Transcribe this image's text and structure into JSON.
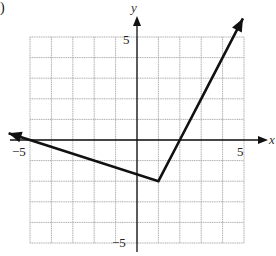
{
  "problem_label": ")",
  "chart_data": {
    "type": "line",
    "title": "",
    "xlabel": "x",
    "ylabel": "y",
    "xlim": [
      -5,
      5
    ],
    "ylim": [
      -5,
      5
    ],
    "grid": true,
    "grid_step": 1,
    "tick_labels": {
      "x": [
        "-5",
        "5"
      ],
      "y": [
        "5",
        "-5"
      ]
    },
    "series": [
      {
        "name": "piecewise linear graph",
        "points": [
          [
            -6,
            0.333
          ],
          [
            -5,
            0
          ],
          [
            1,
            -2
          ],
          [
            2,
            0
          ],
          [
            3,
            2
          ],
          [
            4.95,
            5.9
          ]
        ],
        "vertex": [
          1,
          -2
        ],
        "arrows": [
          "left",
          "right"
        ],
        "color": "#111111"
      }
    ]
  },
  "labels": {
    "x_axis": "x",
    "y_axis": "y",
    "x_neg_tick": "−5",
    "x_pos_tick": "5",
    "y_pos_tick": "5",
    "y_neg_tick": "−5"
  },
  "colors": {
    "grid": "#9a9a9a",
    "axis": "#111111",
    "line": "#111111"
  }
}
